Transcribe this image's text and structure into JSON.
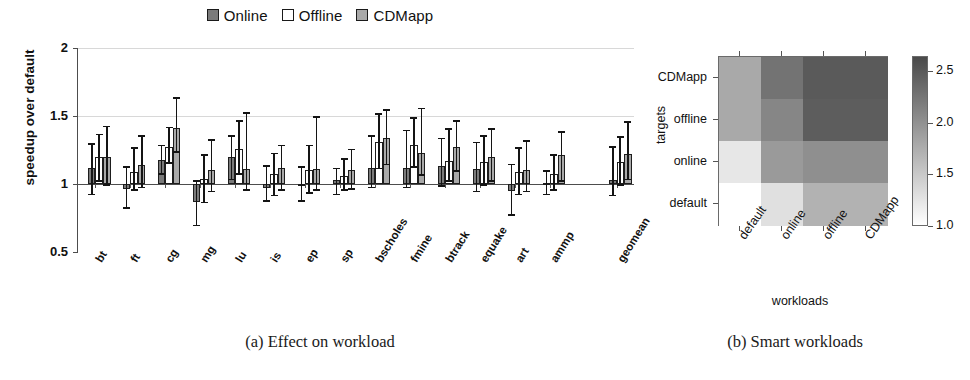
{
  "legend": {
    "items": [
      {
        "label": "Online",
        "color": "#7a7a7a",
        "style": "filled-dark"
      },
      {
        "label": "Offline",
        "color": "#ffffff",
        "style": "open"
      },
      {
        "label": "CDMapp",
        "color": "#a9a9a9",
        "style": "filled-light"
      }
    ]
  },
  "captions": {
    "a": "(a) Effect on workload",
    "b": "(b) Smart workloads"
  },
  "chart_data": [
    {
      "type": "bar",
      "panel": "a",
      "title": "(a) Effect on workload",
      "xlabel": "",
      "ylabel": "speedup over default",
      "ylim": [
        0.5,
        2
      ],
      "yticks": [
        "0.5",
        "1",
        "1.5",
        "2"
      ],
      "ytick_values": [
        0.5,
        1,
        1.5,
        2
      ],
      "grid": true,
      "baseline": 1,
      "legend_position": "top-center",
      "categories": [
        "bt",
        "ft",
        "cg",
        "mg",
        "lu",
        "is",
        "ep",
        "sp",
        "bscholes",
        "fmine",
        "btrack",
        "equake",
        "art",
        "ammp",
        "geomean"
      ],
      "series": [
        {
          "name": "Online",
          "color": "#7a7a7a",
          "values": [
            1.12,
            0.96,
            1.18,
            0.87,
            1.2,
            0.97,
            1.0,
            1.03,
            1.12,
            1.12,
            1.13,
            1.11,
            0.95,
            1.01,
            1.03
          ],
          "err_low": [
            0.93,
            0.83,
            1.08,
            0.7,
            1.04,
            0.88,
            0.88,
            0.93,
            0.98,
            0.98,
            0.99,
            0.95,
            0.78,
            0.93,
            0.92
          ],
          "err_high": [
            1.3,
            1.13,
            1.29,
            1.03,
            1.36,
            1.14,
            1.13,
            1.12,
            1.36,
            1.4,
            1.34,
            1.31,
            1.15,
            1.1,
            1.28
          ]
        },
        {
          "name": "Offline",
          "color": "#ffffff",
          "values": [
            1.2,
            1.09,
            1.27,
            1.04,
            1.26,
            1.07,
            1.1,
            1.06,
            1.31,
            1.29,
            1.17,
            1.16,
            1.09,
            1.07,
            1.16
          ],
          "err_low": [
            1.03,
            0.96,
            1.16,
            0.87,
            1.08,
            0.92,
            0.94,
            0.96,
            1.12,
            1.13,
            1.03,
            1.0,
            0.93,
            0.96,
            1.0
          ],
          "err_high": [
            1.37,
            1.27,
            1.42,
            1.22,
            1.47,
            1.23,
            1.29,
            1.19,
            1.52,
            1.49,
            1.41,
            1.36,
            1.27,
            1.22,
            1.35
          ]
        },
        {
          "name": "CDMapp",
          "color": "#a9a9a9",
          "values": [
            1.2,
            1.14,
            1.41,
            1.1,
            1.11,
            1.12,
            1.11,
            1.1,
            1.34,
            1.23,
            1.27,
            1.2,
            1.1,
            1.21,
            1.22
          ],
          "err_low": [
            1.0,
            0.98,
            1.24,
            0.95,
            0.96,
            0.96,
            0.96,
            0.97,
            1.15,
            1.07,
            1.1,
            1.03,
            0.95,
            1.03,
            1.04
          ],
          "err_high": [
            1.43,
            1.36,
            1.64,
            1.33,
            1.53,
            1.29,
            1.5,
            1.26,
            1.55,
            1.56,
            1.47,
            1.41,
            1.32,
            1.39,
            1.46
          ]
        }
      ]
    },
    {
      "type": "heatmap",
      "panel": "b",
      "title": "(b) Smart workloads",
      "xlabel": "workloads",
      "ylabel": "targets",
      "x_categories": [
        "default",
        "online",
        "offline",
        "CDMapp"
      ],
      "y_categories": [
        "default",
        "online",
        "offline",
        "CDMapp"
      ],
      "colorbar": {
        "ticks": [
          "1.0",
          "1.5",
          "2.0",
          "2.5"
        ],
        "tick_values": [
          1.0,
          1.5,
          2.0,
          2.5
        ],
        "vmin": 1.0,
        "vmax": 2.65,
        "low_color": "#ffffff",
        "high_color": "#4a4a4a"
      },
      "rows": [
        {
          "target": "CDMapp",
          "values": [
            1.78,
            2.28,
            2.5,
            2.5
          ]
        },
        {
          "target": "offline",
          "values": [
            1.78,
            2.1,
            2.48,
            2.48
          ]
        },
        {
          "target": "online",
          "values": [
            1.22,
            1.92,
            2.02,
            2.02
          ]
        },
        {
          "target": "default",
          "values": [
            1.0,
            1.28,
            1.7,
            1.7
          ]
        }
      ]
    }
  ]
}
